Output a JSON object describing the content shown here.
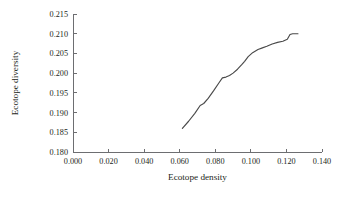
{
  "chart_data": {
    "type": "line",
    "title": "",
    "xlabel": "Ecotope density",
    "ylabel": "Ecotope diversity",
    "xlim": [
      0.0,
      0.14
    ],
    "ylim": [
      0.18,
      0.215
    ],
    "xticks": [
      "0.000",
      "0.020",
      "0.040",
      "0.060",
      "0.080",
      "0.100",
      "0.120",
      "0.140"
    ],
    "xtick_values": [
      0.0,
      0.02,
      0.04,
      0.06,
      0.08,
      0.1,
      0.12,
      0.14
    ],
    "yticks": [
      "0.180",
      "0.185",
      "0.190",
      "0.195",
      "0.200",
      "0.205",
      "0.210",
      "0.215"
    ],
    "ytick_values": [
      0.18,
      0.185,
      0.19,
      0.195,
      0.2,
      0.205,
      0.21,
      0.215
    ],
    "grid": false,
    "legend": "none",
    "line_color": "#4a4a4a",
    "axis_color": "#6d6e71",
    "series": [
      {
        "name": "Ecotope diversity vs density",
        "x": [
          0.0615,
          0.065,
          0.0685,
          0.0715,
          0.0735,
          0.076,
          0.079,
          0.082,
          0.084,
          0.086,
          0.088,
          0.09,
          0.0925,
          0.095,
          0.0965,
          0.0985,
          0.101,
          0.104,
          0.1065,
          0.109,
          0.112,
          0.115,
          0.118,
          0.1205,
          0.122,
          0.1235,
          0.125,
          0.1265
        ],
        "y": [
          0.186,
          0.1878,
          0.1898,
          0.1918,
          0.1923,
          0.1936,
          0.1955,
          0.1975,
          0.1988,
          0.199,
          0.1994,
          0.2,
          0.201,
          0.2022,
          0.203,
          0.2042,
          0.2052,
          0.206,
          0.2064,
          0.2068,
          0.2074,
          0.2078,
          0.2081,
          0.2086,
          0.2098,
          0.21,
          0.21,
          0.21
        ]
      }
    ]
  }
}
